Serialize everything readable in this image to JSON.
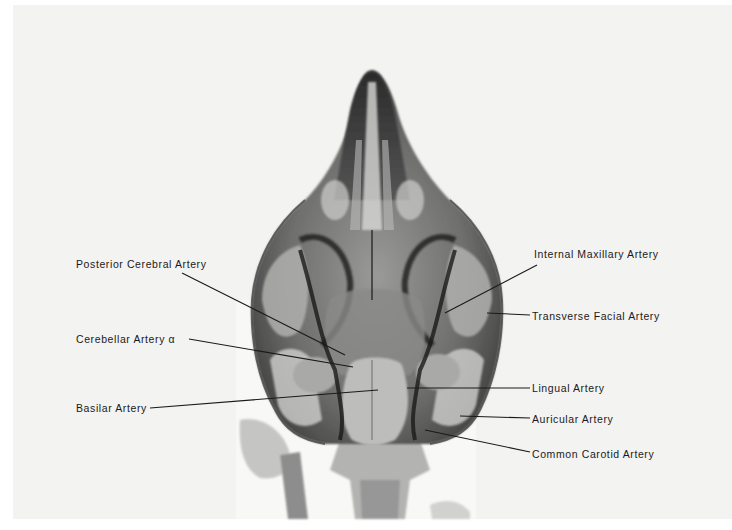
{
  "figure": {
    "labels_left": [
      {
        "text": "Posterior Cerebral Artery",
        "x": 76,
        "y": 258,
        "line": [
          182,
          273,
          345,
          355
        ]
      },
      {
        "text": "Cerebellar Artery α",
        "x": 76,
        "y": 333,
        "line": [
          189,
          339,
          353,
          367
        ]
      },
      {
        "text": "Basilar Artery",
        "x": 76,
        "y": 402,
        "line": [
          150,
          408,
          378,
          390
        ]
      }
    ],
    "labels_right": [
      {
        "text": "Internal Maxillary Artery",
        "x": 534,
        "y": 248,
        "line": [
          537,
          265,
          445,
          313
        ]
      },
      {
        "text": "Transverse Facial Artery",
        "x": 532,
        "y": 310,
        "line": [
          530,
          315,
          487,
          313
        ]
      },
      {
        "text": "Lingual Artery",
        "x": 532,
        "y": 382,
        "line": [
          530,
          388,
          407,
          388
        ]
      },
      {
        "text": "Auricular Artery",
        "x": 532,
        "y": 413,
        "line": [
          530,
          418,
          460,
          416
        ]
      },
      {
        "text": "Common Carotid Artery",
        "x": 532,
        "y": 448,
        "line": [
          530,
          452,
          425,
          430
        ]
      }
    ],
    "colors": {
      "plate": "#f3f3f2",
      "ink": "#1a1a1a",
      "bone_dark": "#2a2a2a",
      "bone_mid": "#8a8a8a",
      "bone_light": "#c8c8c6"
    }
  }
}
